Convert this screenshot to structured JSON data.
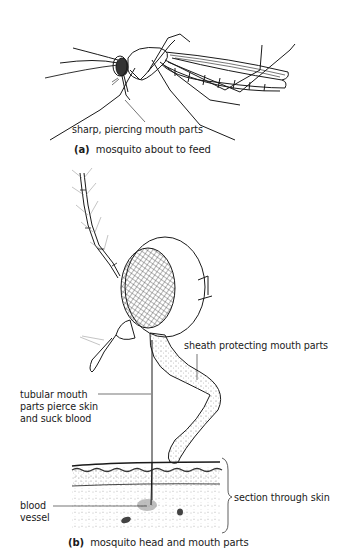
{
  "figure_a": {
    "label_mouthparts": "sharp, piercing mouth parts",
    "caption_letter": "(a)",
    "caption_text": "mosquito about to feed"
  },
  "figure_b": {
    "label_sheath": "sheath protecting mouth parts",
    "label_tubular_line1": "tubular mouth",
    "label_tubular_line2": "parts pierce skin",
    "label_tubular_line3": "and suck blood",
    "label_skin": "section through skin",
    "label_blood_line1": "blood",
    "label_blood_line2": "vessel",
    "caption_letter": "(b)",
    "caption_text": "mosquito head and mouth parts"
  },
  "colors": {
    "ink": "#1a1a1a",
    "background": "#ffffff",
    "stipple": "#555555"
  }
}
